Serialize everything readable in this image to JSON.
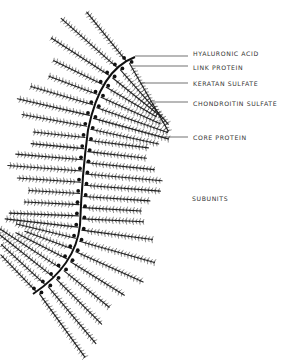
{
  "diagram": {
    "title": "",
    "labels": [
      {
        "id": "hyaluronic-acid",
        "text": "HYALURONIC ACID",
        "x": 193,
        "y": 53,
        "leader_from": [
          135,
          56
        ],
        "leader_to": [
          188,
          56
        ]
      },
      {
        "id": "link-protein",
        "text": "LINK PROTEIN",
        "x": 193,
        "y": 67,
        "leader_from": [
          131,
          66
        ],
        "leader_to": [
          188,
          66
        ]
      },
      {
        "id": "keratan-sulfate",
        "text": "KERATAN SULFATE",
        "x": 193,
        "y": 83,
        "leader_from": [
          140,
          83
        ],
        "leader_to": [
          188,
          83
        ]
      },
      {
        "id": "chondroitin-sulfate",
        "text": "CHONDROITIN SULFATE",
        "x": 193,
        "y": 103,
        "leader_from": [
          153,
          102
        ],
        "leader_to": [
          188,
          102
        ]
      },
      {
        "id": "core-protein",
        "text": "CORE PROTEIN",
        "x": 193,
        "y": 134,
        "leader_from": [
          160,
          137
        ],
        "leader_to": [
          188,
          137
        ]
      },
      {
        "id": "subunits",
        "text": "SUBUNITS",
        "x": 192,
        "y": 197
      }
    ],
    "components": [
      "hyaluronic acid backbone",
      "link protein dots",
      "core protein strands",
      "chondroitin sulfate side chains",
      "keratan sulfate side chains"
    ],
    "color": "#222222"
  }
}
